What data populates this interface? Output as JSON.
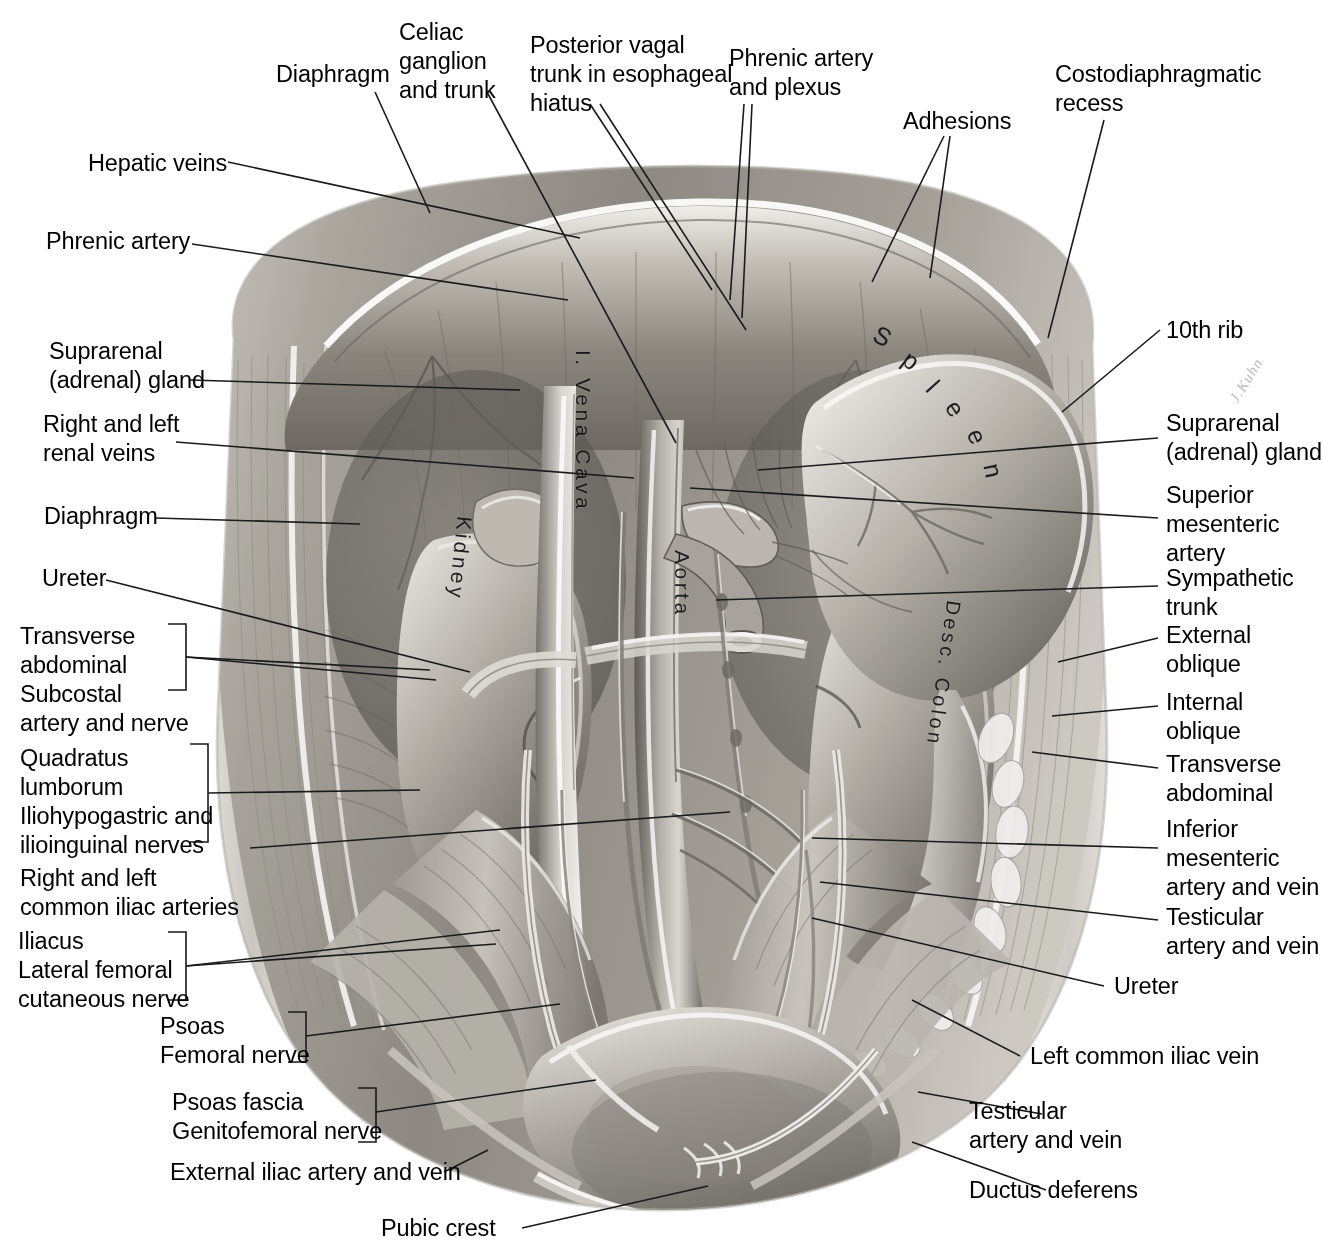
{
  "plate": {
    "title": "Posterior abdominal wall dissection",
    "signature": "J.Kuhn"
  },
  "in_image_labels": [
    {
      "name": "spleen",
      "text": "Spleen"
    },
    {
      "name": "kidney",
      "text": "Kidney"
    },
    {
      "name": "vena-cava",
      "text": "I. Vena Cava"
    },
    {
      "name": "aorta",
      "text": "Aorta"
    },
    {
      "name": "desc-colon",
      "text": "Desc. Colon"
    }
  ],
  "labels_top": [
    {
      "name": "diaphragm-top",
      "text": "Diaphragm"
    },
    {
      "name": "celiac-ganglion",
      "text": "Celiac\nganglion\nand trunk"
    },
    {
      "name": "posterior-vagal-trunk",
      "text": "Posterior vagal\ntrunk in esophageal\nhiatus"
    },
    {
      "name": "phrenic-artery-plexus",
      "text": "Phrenic artery\nand plexus"
    },
    {
      "name": "adhesions",
      "text": "Adhesions"
    },
    {
      "name": "costodiaphragmatic",
      "text": "Costodiaphragmatic\nrecess"
    }
  ],
  "labels_left": [
    {
      "name": "hepatic-veins",
      "text": "Hepatic veins"
    },
    {
      "name": "phrenic-artery",
      "text": "Phrenic artery"
    },
    {
      "name": "suprarenal-gland-left",
      "text": "Suprarenal\n(adrenal) gland"
    },
    {
      "name": "renal-veins",
      "text": "Right and left\nrenal veins"
    },
    {
      "name": "diaphragm-left",
      "text": "Diaphragm"
    },
    {
      "name": "ureter-left",
      "text": "Ureter"
    },
    {
      "name": "transverse-abdominal-subcostal",
      "text": "Transverse\nabdominal\nSubcostal\nartery and nerve"
    },
    {
      "name": "quadratus-lumborum",
      "text": "Quadratus\nlumborum\nIliohypogastric and\nilioinguinal nerves"
    },
    {
      "name": "common-iliac-arteries",
      "text": "Right and left\ncommon iliac arteries"
    },
    {
      "name": "iliacus-lateral-femoral",
      "text": "Iliacus\nLateral femoral\ncutaneous nerve"
    },
    {
      "name": "psoas-femoral-nerve",
      "text": "Psoas\nFemoral nerve"
    },
    {
      "name": "psoas-fascia-genitofemoral",
      "text": "Psoas fascia\nGenitofemoral nerve"
    },
    {
      "name": "external-iliac-artery-vein",
      "text": "External iliac artery and vein"
    },
    {
      "name": "pubic-crest",
      "text": "Pubic crest"
    }
  ],
  "labels_right": [
    {
      "name": "tenth-rib",
      "text": "10th rib"
    },
    {
      "name": "suprarenal-gland-right",
      "text": "Suprarenal\n(adrenal) gland"
    },
    {
      "name": "superior-mesenteric-artery",
      "text": "Superior\nmesenteric\nartery"
    },
    {
      "name": "sympathetic-trunk",
      "text": "Sympathetic\ntrunk"
    },
    {
      "name": "external-oblique",
      "text": "External\noblique"
    },
    {
      "name": "internal-oblique",
      "text": "Internal\noblique"
    },
    {
      "name": "transverse-abdominal-right",
      "text": "Transverse\nabdominal"
    },
    {
      "name": "inferior-mesenteric",
      "text": "Inferior\nmesenteric\nartery and vein"
    },
    {
      "name": "testicular-artery-vein-upper",
      "text": "Testicular\nartery and vein"
    },
    {
      "name": "ureter-right",
      "text": "Ureter"
    },
    {
      "name": "left-common-iliac-vein",
      "text": "Left common iliac vein"
    },
    {
      "name": "testicular-artery-vein-lower",
      "text": "Testicular\nartery and vein"
    },
    {
      "name": "ductus-deferens",
      "text": "Ductus deferens"
    }
  ],
  "colors": {
    "ink": "#1a1a1a",
    "paper": "#ffffff",
    "wash_light": "#d9d6d1",
    "wash_mid": "#9a968f",
    "wash_dark": "#5d5a55",
    "wash_darkest": "#34322e"
  }
}
